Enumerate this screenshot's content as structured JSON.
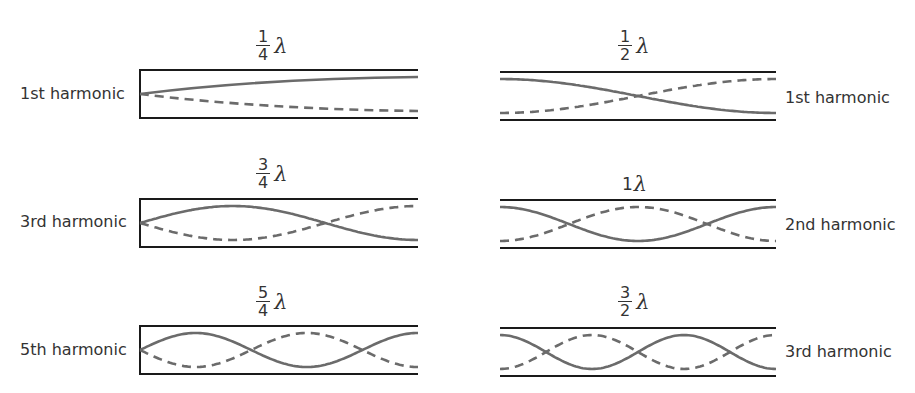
{
  "colors": {
    "wall": "#1a1a1a",
    "wave": "#6b6b6b",
    "text": "#333333"
  },
  "closed_pipes": [
    {
      "id": "closed-1",
      "harmonic_label": "1st harmonic",
      "length_num": "1",
      "length_den": "4",
      "length_symbol": "λ",
      "quarter_waves": 1
    },
    {
      "id": "closed-3",
      "harmonic_label": "3rd harmonic",
      "length_num": "3",
      "length_den": "4",
      "length_symbol": "λ",
      "quarter_waves": 3
    },
    {
      "id": "closed-5",
      "harmonic_label": "5th harmonic",
      "length_num": "5",
      "length_den": "4",
      "length_symbol": "λ",
      "quarter_waves": 5
    }
  ],
  "open_pipes": [
    {
      "id": "open-1",
      "harmonic_label": "1st harmonic",
      "length_num": "1",
      "length_den": "2",
      "length_symbol": "λ",
      "half_waves": 1
    },
    {
      "id": "open-2",
      "harmonic_label": "2nd harmonic",
      "length_whole": "1",
      "length_symbol": "λ",
      "half_waves": 2
    },
    {
      "id": "open-3",
      "harmonic_label": "3rd harmonic",
      "length_num": "3",
      "length_den": "2",
      "length_symbol": "λ",
      "half_waves": 3
    }
  ]
}
